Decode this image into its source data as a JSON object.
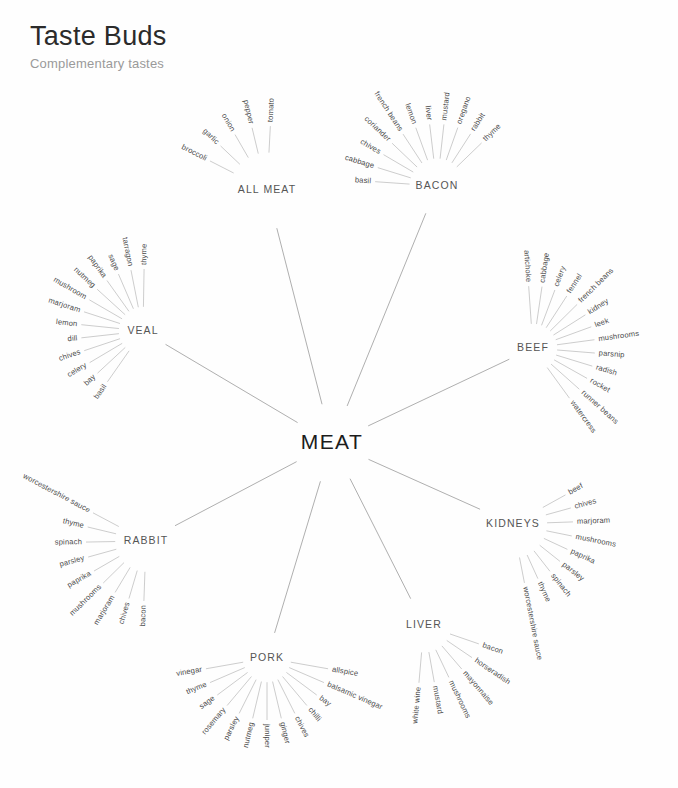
{
  "header": {
    "title": "Taste Buds",
    "subtitle": "Complementary tastes"
  },
  "colors": {
    "background": "#fefefe",
    "title": "#2b2b2b",
    "subtitle": "#9a9a9a",
    "center_label": "#1c1c1c",
    "hub_label": "#555555",
    "leaf_label": "#4a4a4a",
    "spoke_main": "#8d8d8d",
    "spoke_leaf": "#a3a3a3"
  },
  "chart_data": {
    "type": "radial-hierarchy",
    "title": "Taste Buds",
    "subtitle": "Complementary tastes",
    "center": {
      "label": "MEAT",
      "x": 332,
      "y": 443
    },
    "groups": [
      {
        "label": "ALL MEAT",
        "hub_x": 267,
        "hub_y": 190,
        "fan_center_deg": 240,
        "fan_span_deg": 66,
        "leaf_radius": 64,
        "label_offset": 4,
        "items": [
          "broccoli",
          "garlic",
          "onion",
          "pepper",
          "tomato"
        ]
      },
      {
        "label": "BACON",
        "hub_x": 437,
        "hub_y": 186,
        "fan_center_deg": 250,
        "fan_span_deg": 132,
        "leaf_radius": 62,
        "label_offset": 4,
        "items": [
          "basil",
          "cabbage",
          "chives",
          "coriander",
          "french beans",
          "lemon",
          "liver",
          "mustard",
          "oregano",
          "rabbit",
          "thyme"
        ]
      },
      {
        "label": "VEAL",
        "hub_x": 143,
        "hub_y": 331,
        "fan_center_deg": 198,
        "fan_span_deg": 146,
        "leaf_radius": 62,
        "label_offset": 4,
        "items": [
          "basil",
          "bay",
          "celery",
          "chives",
          "dill",
          "lemon",
          "marjoram",
          "mushroom",
          "nutmeg",
          "paprika",
          "sage",
          "tarragon",
          "thyme"
        ]
      },
      {
        "label": "BEEF",
        "hub_x": 533,
        "hub_y": 348,
        "fan_center_deg": 340,
        "fan_span_deg": 148,
        "leaf_radius": 62,
        "label_offset": 4,
        "items": [
          "artichoke",
          "cabbage",
          "celery",
          "fennel",
          "french beans",
          "kidney",
          "leek",
          "mushrooms",
          "parsnip",
          "radish",
          "rocket",
          "runner beans",
          "watercress"
        ]
      },
      {
        "label": "KIDNEYS",
        "hub_x": 513,
        "hub_y": 524,
        "fan_center_deg": 25,
        "fan_span_deg": 108,
        "leaf_radius": 60,
        "label_offset": 4,
        "items": [
          "beef",
          "chives",
          "marjoram",
          "mushrooms",
          "paprika",
          "parsley",
          "spinach",
          "thyme",
          "worcestershire sauce"
        ]
      },
      {
        "label": "LIVER",
        "hub_x": 424,
        "hub_y": 625,
        "fan_center_deg": 57,
        "fan_span_deg": 76,
        "leaf_radius": 58,
        "label_offset": 4,
        "items": [
          "bacon",
          "horseradish",
          "mayonnaise",
          "mushrooms",
          "mustard",
          "white wine"
        ]
      },
      {
        "label": "PORK",
        "hub_x": 267,
        "hub_y": 658,
        "fan_center_deg": 90,
        "fan_span_deg": 160,
        "leaf_radius": 62,
        "label_offset": 4,
        "items": [
          "allspice",
          "balsamic vinegar",
          "bay",
          "chilli",
          "chives",
          "ginger",
          "juniper",
          "nutmeg",
          "parsley",
          "rosemary",
          "sage",
          "thyme",
          "vinegar"
        ]
      },
      {
        "label": "RABBIT",
        "hub_x": 146,
        "hub_y": 541,
        "fan_center_deg": 150,
        "fan_span_deg": 116,
        "leaf_radius": 60,
        "label_offset": 4,
        "items": [
          "bacon",
          "chives",
          "marjoram",
          "mushrooms",
          "paprika",
          "parsley",
          "spinach",
          "thyme",
          "worcestershire sauce"
        ]
      }
    ]
  }
}
